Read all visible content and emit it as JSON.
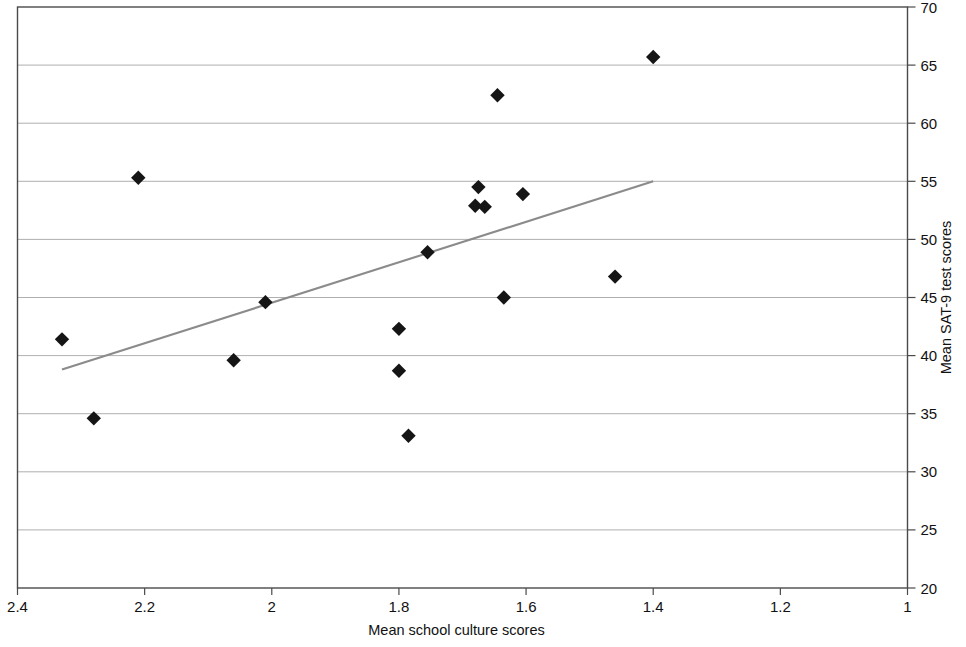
{
  "chart_data": {
    "type": "scatter",
    "title": "",
    "xlabel": "Mean school culture scores",
    "ylabel": "Mean SAT-9 test scores",
    "xlim": [
      2.4,
      1.0
    ],
    "ylim": [
      20,
      70
    ],
    "x_reversed": true,
    "xticks": [
      2.4,
      2.2,
      2.0,
      1.8,
      1.6,
      1.4,
      1.2,
      1.0
    ],
    "xtick_labels": [
      "2.4",
      "2.2",
      "2",
      "1.8",
      "1.6",
      "1.4",
      "1.2",
      "1"
    ],
    "yticks": [
      20,
      25,
      30,
      35,
      40,
      45,
      50,
      55,
      60,
      65,
      70
    ],
    "ytick_labels": [
      "20",
      "25",
      "30",
      "35",
      "40",
      "45",
      "50",
      "55",
      "60",
      "65",
      "70"
    ],
    "grid": "horizontal",
    "y_axis_position": "right",
    "legend": "none",
    "marker_shape": "diamond",
    "marker_color": "#151515",
    "trendline_color": "#8b8b8b",
    "points": [
      {
        "x": 2.33,
        "y": 41.4
      },
      {
        "x": 2.28,
        "y": 34.6
      },
      {
        "x": 2.21,
        "y": 55.3
      },
      {
        "x": 2.06,
        "y": 39.6
      },
      {
        "x": 2.01,
        "y": 44.6
      },
      {
        "x": 1.8,
        "y": 42.3
      },
      {
        "x": 1.8,
        "y": 38.7
      },
      {
        "x": 1.785,
        "y": 33.1
      },
      {
        "x": 1.755,
        "y": 48.9
      },
      {
        "x": 1.675,
        "y": 54.5
      },
      {
        "x": 1.68,
        "y": 52.9
      },
      {
        "x": 1.665,
        "y": 52.8
      },
      {
        "x": 1.645,
        "y": 62.4
      },
      {
        "x": 1.635,
        "y": 45.0
      },
      {
        "x": 1.605,
        "y": 53.9
      },
      {
        "x": 1.46,
        "y": 46.8
      },
      {
        "x": 1.4,
        "y": 65.7
      }
    ],
    "trendline": {
      "x1": 2.33,
      "y1": 38.8,
      "x2": 1.4,
      "y2": 55.0
    }
  }
}
